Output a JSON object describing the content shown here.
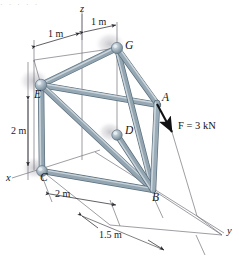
{
  "figure": {
    "kind": "space-truss-free-body-diagram",
    "background_color": "#ffffff",
    "member_color": "#8fa2ae",
    "member_light": "#cfd8de",
    "member_dark": "#5e7180",
    "joint_color": "#9fb0bb",
    "line_color": "#6f6f76",
    "arrow_color": "#111114"
  },
  "top_partial_text": "· ·   ·    ·   ·",
  "axes": [
    {
      "name": "z-axis",
      "label": "z",
      "x": 80,
      "y": 6
    },
    {
      "name": "x-axis",
      "label": "x",
      "x": 7,
      "y": 177
    },
    {
      "name": "y-axis",
      "label": "y",
      "x": 227,
      "y": 230
    }
  ],
  "joints": [
    {
      "name": "G",
      "label": "G",
      "cx": 117,
      "cy": 48,
      "lx": 125,
      "ly": 42
    },
    {
      "name": "E",
      "label": "E",
      "cx": 41,
      "cy": 85,
      "lx": 35,
      "ly": 92
    },
    {
      "name": "D",
      "label": "D",
      "cx": 117,
      "cy": 135,
      "lx": 125,
      "ly": 126
    },
    {
      "name": "C",
      "label": "C",
      "cx": 42,
      "cy": 171,
      "lx": 40,
      "ly": 176
    },
    {
      "name": "A",
      "label": "A",
      "cx": 158,
      "cy": 105,
      "lx": 162,
      "ly": 94
    },
    {
      "name": "B",
      "label": "B",
      "cx": 153,
      "cy": 190,
      "lx": 153,
      "ly": 193
    }
  ],
  "members": [
    {
      "name": "member-G-B",
      "from": "G",
      "to": "B"
    },
    {
      "name": "member-G-A",
      "from": "G",
      "to": "A"
    },
    {
      "name": "member-E-G",
      "from": "E",
      "to": "G"
    },
    {
      "name": "member-E-A",
      "from": "E",
      "to": "A"
    },
    {
      "name": "member-E-B",
      "from": "E",
      "to": "B"
    },
    {
      "name": "member-E-C",
      "from": "E",
      "to": "C"
    },
    {
      "name": "member-D-B",
      "from": "D",
      "to": "B"
    },
    {
      "name": "member-C-B",
      "from": "C",
      "to": "B"
    },
    {
      "name": "member-A-B",
      "from": "A",
      "to": "B"
    }
  ],
  "force": {
    "name": "applied-force",
    "label": "F = 3 kN",
    "symbol": "F",
    "equals": "=",
    "magnitude": "3",
    "unit": "kN",
    "tail_x": 157,
    "tail_y": 104,
    "head_x": 172,
    "head_y": 132,
    "label_x": 178,
    "label_y": 126
  },
  "dimensions": [
    {
      "name": "dim-top-left-1m",
      "label": "1 m",
      "x": 48,
      "y": 35
    },
    {
      "name": "dim-top-right-1m",
      "label": "1 m",
      "x": 92,
      "y": 20
    },
    {
      "name": "dim-vertical-2m",
      "label": "2 m",
      "x": 13,
      "y": 123
    },
    {
      "name": "dim-base-2m",
      "label": "2 m",
      "x": 55,
      "y": 191
    },
    {
      "name": "dim-base-1p5m",
      "label": "1.5 m",
      "x": 101,
      "y": 232
    }
  ]
}
